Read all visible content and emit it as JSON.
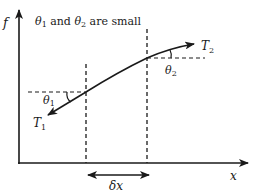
{
  "diagram": {
    "title": "θ",
    "caption": {
      "theta1": "θ",
      "sub1": "1",
      "and": " and ",
      "theta2": "θ",
      "sub2": "2",
      "rest": " are small"
    },
    "axes": {
      "y_label": "f",
      "x_label": "x"
    },
    "labels": {
      "T1": "T",
      "T1_sub": "1",
      "T2": "T",
      "T2_sub": "2",
      "theta1": "θ",
      "theta1_sub": "1",
      "theta2": "θ",
      "theta2_sub": "2",
      "delta_x": "δx"
    },
    "colors": {
      "line": "#1a1a1a",
      "background": "#ffffff"
    }
  }
}
